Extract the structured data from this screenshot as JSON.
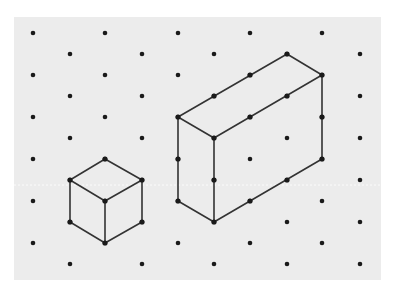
{
  "figure": {
    "title": "",
    "kind": "isometric-dot-paper",
    "colors": {
      "page_background": "#ffffff",
      "paper": "#ececec",
      "dot": "#1a1a1a",
      "edge": "#333333",
      "scanline": "#ffffff"
    },
    "paper": {
      "x": 14,
      "y": 17,
      "width": 367,
      "height": 263
    },
    "grid": {
      "even_row_x": [
        33,
        105,
        178,
        250,
        322
      ],
      "even_row_y": [
        33,
        75,
        117,
        159,
        201,
        243
      ],
      "odd_row_x": [
        70,
        142,
        214,
        287,
        360
      ],
      "odd_row_y": [
        54,
        96,
        138,
        180,
        222,
        264
      ],
      "dot_radius": 2.3
    },
    "scanline_y": 185,
    "shapes": [
      {
        "name": "cube",
        "description": "1x1x1 isometric cube",
        "vertices": [
          [
            105,
            159
          ],
          [
            142,
            180
          ],
          [
            142,
            222
          ],
          [
            105,
            243
          ],
          [
            70,
            222
          ],
          [
            70,
            180
          ],
          [
            105,
            201
          ]
        ],
        "edges": [
          [
            [
              105,
              159
            ],
            [
              142,
              180
            ]
          ],
          [
            [
              142,
              180
            ],
            [
              142,
              222
            ]
          ],
          [
            [
              142,
              222
            ],
            [
              105,
              243
            ]
          ],
          [
            [
              105,
              243
            ],
            [
              70,
              222
            ]
          ],
          [
            [
              70,
              222
            ],
            [
              70,
              180
            ]
          ],
          [
            [
              70,
              180
            ],
            [
              105,
              159
            ]
          ],
          [
            [
              70,
              180
            ],
            [
              105,
              201
            ]
          ],
          [
            [
              142,
              180
            ],
            [
              105,
              201
            ]
          ],
          [
            [
              105,
              201
            ],
            [
              105,
              243
            ]
          ]
        ]
      },
      {
        "name": "cuboid",
        "description": "cuboid 1 unit wide, 3 units long, 2 units tall",
        "vertices": [
          [
            287,
            54
          ],
          [
            322,
            75
          ],
          [
            178,
            117
          ],
          [
            214,
            138
          ],
          [
            322,
            159
          ],
          [
            178,
            201
          ],
          [
            214,
            222
          ]
        ],
        "edge_midpoints": [
          [
            250,
            75
          ],
          [
            214,
            96
          ],
          [
            287,
            96
          ],
          [
            250,
            117
          ],
          [
            322,
            117
          ],
          [
            178,
            159
          ],
          [
            214,
            180
          ],
          [
            287,
            180
          ],
          [
            250,
            201
          ]
        ],
        "edges": [
          [
            [
              287,
              54
            ],
            [
              322,
              75
            ]
          ],
          [
            [
              287,
              54
            ],
            [
              178,
              117
            ]
          ],
          [
            [
              178,
              117
            ],
            [
              214,
              138
            ]
          ],
          [
            [
              214,
              138
            ],
            [
              322,
              75
            ]
          ],
          [
            [
              322,
              75
            ],
            [
              322,
              159
            ]
          ],
          [
            [
              178,
              117
            ],
            [
              178,
              201
            ]
          ],
          [
            [
              214,
              138
            ],
            [
              214,
              222
            ]
          ],
          [
            [
              178,
              201
            ],
            [
              214,
              222
            ]
          ],
          [
            [
              214,
              222
            ],
            [
              322,
              159
            ]
          ]
        ]
      }
    ]
  }
}
